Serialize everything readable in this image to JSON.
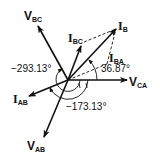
{
  "diagram": {
    "type": "phasor-diagram",
    "vectors": [
      {
        "id": "V_BC",
        "main": "V",
        "sub": "BC",
        "style": "solid"
      },
      {
        "id": "I_BC",
        "main": "I",
        "sub": "BC",
        "style": "solid"
      },
      {
        "id": "I_B",
        "main": "I",
        "sub": "B",
        "style": "solid"
      },
      {
        "id": "I_BA",
        "main": "I",
        "sub": "BA",
        "style": "dashed"
      },
      {
        "id": "V_CA",
        "main": "V",
        "sub": "CA",
        "style": "solid"
      },
      {
        "id": "I_AB",
        "main": "I",
        "sub": "AB",
        "style": "solid"
      },
      {
        "id": "V_AB",
        "main": "V",
        "sub": "AB",
        "style": "solid"
      }
    ],
    "angles": {
      "a36": "36.87°",
      "a293": "−293.13°",
      "a173": "−173.13°"
    },
    "colors": {
      "ink": "#111111",
      "background": "#ffffff"
    }
  }
}
